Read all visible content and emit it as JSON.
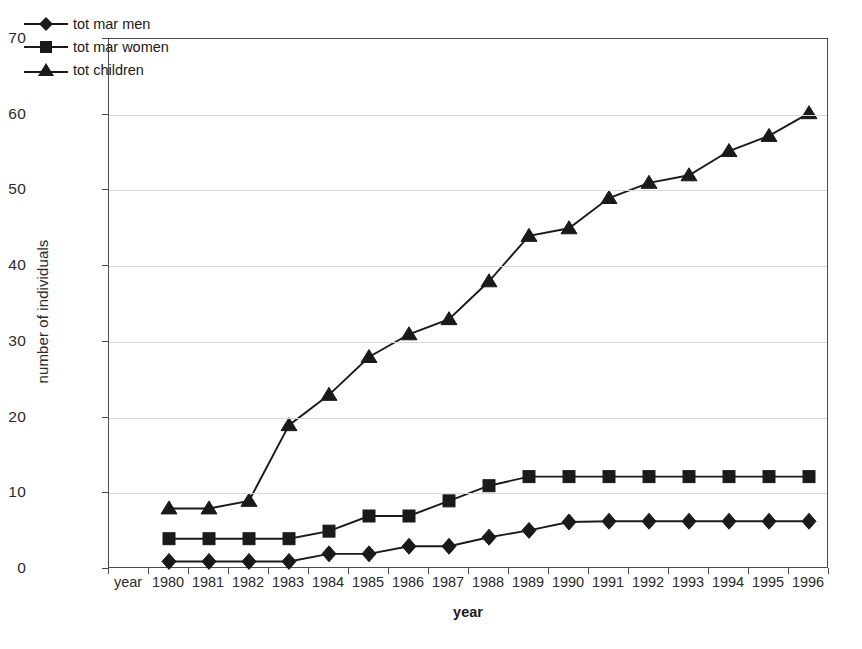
{
  "chart_data": {
    "type": "line",
    "title": "",
    "xlabel": "year",
    "ylabel": "number of individuals",
    "categories": [
      "year",
      "1980",
      "1981",
      "1982",
      "1983",
      "1984",
      "1985",
      "1986",
      "1987",
      "1988",
      "1989",
      "1990",
      "1991",
      "1992",
      "1993",
      "1994",
      "1995",
      "1996"
    ],
    "ylim": [
      0,
      70
    ],
    "yticks": [
      0,
      10,
      20,
      30,
      40,
      50,
      60,
      70
    ],
    "grid": true,
    "legend_position": "top-left",
    "series": [
      {
        "name": "tot mar men",
        "marker": "diamond",
        "x": [
          "1980",
          "1981",
          "1982",
          "1983",
          "1984",
          "1985",
          "1986",
          "1987",
          "1988",
          "1989",
          "1990",
          "1991",
          "1992",
          "1993",
          "1994",
          "1995",
          "1996"
        ],
        "values": [
          1,
          1,
          1,
          1,
          2,
          2,
          3,
          3,
          4.2,
          5.1,
          6.2,
          6.3,
          6.3,
          6.3,
          6.3,
          6.3,
          6.3
        ]
      },
      {
        "name": "tot mar women",
        "marker": "square",
        "x": [
          "1980",
          "1981",
          "1982",
          "1983",
          "1984",
          "1985",
          "1986",
          "1987",
          "1988",
          "1989",
          "1990",
          "1991",
          "1992",
          "1993",
          "1994",
          "1995",
          "1996"
        ],
        "values": [
          4,
          4,
          4,
          4,
          5,
          7,
          7,
          9,
          11,
          12.2,
          12.2,
          12.2,
          12.2,
          12.2,
          12.2,
          12.2,
          12.2
        ]
      },
      {
        "name": "tot children",
        "marker": "triangle",
        "x": [
          "1980",
          "1981",
          "1982",
          "1983",
          "1984",
          "1985",
          "1986",
          "1987",
          "1988",
          "1989",
          "1990",
          "1991",
          "1992",
          "1993",
          "1994",
          "1995",
          "1996"
        ],
        "values": [
          8,
          8,
          9,
          19,
          23,
          28,
          31,
          33,
          38,
          44,
          45,
          49,
          51,
          52,
          55.2,
          57.2,
          60.2
        ]
      }
    ]
  },
  "axes": {
    "y_label": "number of individuals",
    "x_label": "year",
    "y_tick_labels": [
      "0",
      "10",
      "20",
      "30",
      "40",
      "50",
      "60",
      "70"
    ],
    "x_tick_labels": [
      "year",
      "1980",
      "1981",
      "1982",
      "1983",
      "1984",
      "1985",
      "1986",
      "1987",
      "1988",
      "1989",
      "1990",
      "1991",
      "1992",
      "1993",
      "1994",
      "1995",
      "1996"
    ]
  },
  "legend": {
    "items": [
      {
        "label": "tot mar men",
        "marker": "diamond"
      },
      {
        "label": "tot mar women",
        "marker": "square"
      },
      {
        "label": "tot children",
        "marker": "triangle"
      }
    ]
  },
  "colors": {
    "series": "#1a1a1a",
    "grid": "#d9d9d9",
    "frame": "#4a4a4a",
    "background": "#ffffff"
  }
}
